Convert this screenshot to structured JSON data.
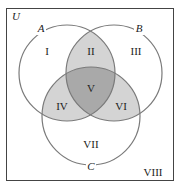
{
  "universe_label": "U",
  "sets": [
    {
      "label": "A",
      "cx": 67,
      "cy": 73,
      "r": 48,
      "label_x": 41,
      "label_y": 32
    },
    {
      "label": "B",
      "cx": 114,
      "cy": 73,
      "r": 48,
      "label_x": 139,
      "label_y": 32
    },
    {
      "label": "C",
      "cx": 91,
      "cy": 116,
      "r": 49,
      "label_x": 91,
      "label_y": 169
    }
  ],
  "regions": [
    {
      "label": "I",
      "x": 47,
      "y": 55
    },
    {
      "label": "II",
      "x": 91,
      "y": 55
    },
    {
      "label": "III",
      "x": 136,
      "y": 55
    },
    {
      "label": "V",
      "x": 91,
      "y": 92
    },
    {
      "label": "IV",
      "x": 62,
      "y": 110
    },
    {
      "label": "VI",
      "x": 121,
      "y": 110
    },
    {
      "label": "VII",
      "x": 91,
      "y": 148
    },
    {
      "label": "VIII",
      "x": 153,
      "y": 173
    }
  ],
  "colors": {
    "stroke": "#7a7a7a",
    "frame": "#444444",
    "shade_light": "#d4d4d4",
    "shade_dark": "#a9a9a9"
  }
}
